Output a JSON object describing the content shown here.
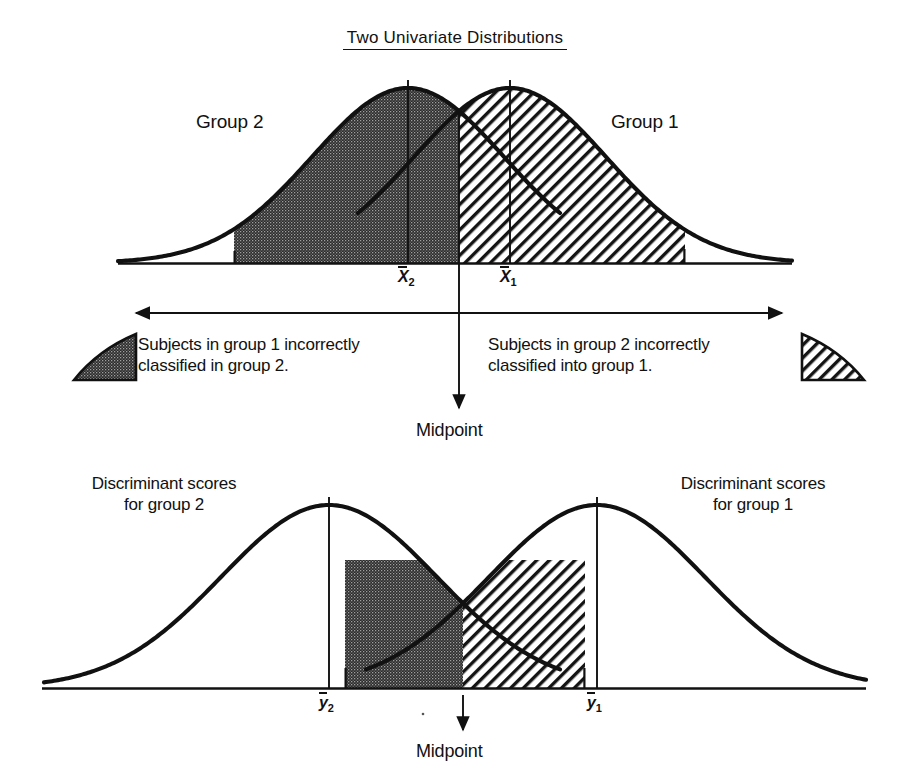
{
  "figure": {
    "title": "Two Univariate Distributions",
    "upper_panel": {
      "group_left_label": "Group 2",
      "group_right_label": "Group 1",
      "mean_left_label": "X",
      "mean_left_sub": "2",
      "mean_right_label": "X",
      "mean_right_sub": "1",
      "midpoint_label": "Midpoint"
    },
    "legend": {
      "left_caption": "Subjects in group 1 incorrectly\nclassified in group 2.",
      "right_caption": "Subjects in group 2 incorrectly\nclassified into group 1.",
      "left_swatch_name": "stippled-tail-swatch",
      "right_swatch_name": "hatched-tail-swatch"
    },
    "lower_panel": {
      "label_left": "Discriminant scores\nfor group 2",
      "label_right": "Discriminant scores\nfor group 1",
      "mean_left_label": "y",
      "mean_left_sub": "2",
      "mean_right_label": "y",
      "mean_right_sub": "1",
      "midpoint_label": "Midpoint"
    },
    "colors": {
      "ink": "#111111",
      "stipple_fill": "#3a3a3a",
      "hatch_stroke": "#111111",
      "background": "#ffffff"
    }
  },
  "chart_data": {
    "type": "line",
    "title": "Two Univariate Distributions",
    "xlabel": "",
    "ylabel": "",
    "grid": false,
    "legend_position": "inline-annotations",
    "panels": [
      {
        "name": "upper-panel-original-variable",
        "baseline_y_px": 263,
        "series": [
          {
            "name": "Group 2",
            "distribution": "normal",
            "mean_px": 408,
            "peak_y_px": 88,
            "sigma_px": 96,
            "mean_label": "X̅2",
            "x_start_px": 118,
            "x_end_px": 560
          },
          {
            "name": "Group 1",
            "distribution": "normal",
            "mean_px": 510,
            "peak_y_px": 88,
            "sigma_px": 96,
            "mean_label": "X̅1",
            "x_start_px": 358,
            "x_end_px": 792
          }
        ],
        "crossing_point_px": [
          459,
          112
        ],
        "shaded_regions": [
          {
            "name": "group-1-misclassified-as-group-2",
            "fill": "stipple",
            "from_px": 234,
            "to_px": 459,
            "description": "right tail of Group 2 curve left of midpoint"
          },
          {
            "name": "group-2-misclassified-as-group-1",
            "fill": "hatch",
            "from_px": 459,
            "to_px": 685,
            "description": "left tail of Group 1 curve right of midpoint"
          }
        ],
        "midpoint_px": 459
      },
      {
        "name": "lower-panel-discriminant-scores",
        "baseline_y_px": 688,
        "series": [
          {
            "name": "Discriminant scores for group 2",
            "distribution": "normal",
            "mean_px": 329,
            "peak_y_px": 505,
            "sigma_px": 108,
            "mean_label": "y̅2",
            "x_start_px": 44,
            "x_end_px": 560
          },
          {
            "name": "Discriminant scores for group 1",
            "distribution": "normal",
            "mean_px": 597,
            "peak_y_px": 505,
            "sigma_px": 108,
            "mean_label": "y̅1",
            "x_start_px": 366,
            "x_end_px": 866
          }
        ],
        "crossing_point_px": [
          463,
          610
        ],
        "shaded_regions": [
          {
            "name": "group-1-misclassified-as-group-2",
            "fill": "stipple",
            "from_px": 345,
            "to_px": 463
          },
          {
            "name": "group-2-misclassified-as-group-1",
            "fill": "hatch",
            "from_px": 463,
            "to_px": 585
          }
        ],
        "midpoint_px": 463
      }
    ]
  }
}
